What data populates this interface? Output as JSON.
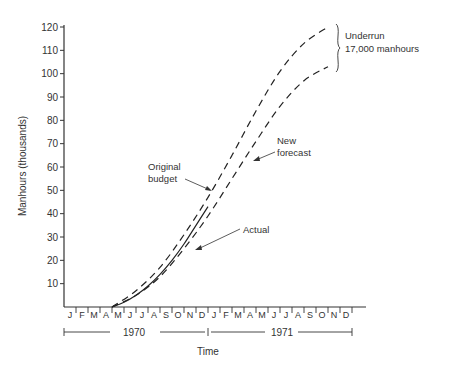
{
  "chart_data": {
    "type": "line",
    "title": "",
    "xlabel": "Time",
    "ylabel": "Manhours (thousands)",
    "ylim": [
      0,
      120
    ],
    "yticks": [
      10,
      20,
      30,
      40,
      50,
      60,
      70,
      80,
      90,
      100,
      110,
      120
    ],
    "months": [
      "J",
      "F",
      "M",
      "A",
      "M",
      "J",
      "J",
      "A",
      "S",
      "O",
      "N",
      "D",
      "J",
      "F",
      "M",
      "A",
      "M",
      "J",
      "J",
      "A",
      "S",
      "O",
      "N",
      "D"
    ],
    "years": [
      "1970",
      "1971"
    ],
    "grid": false,
    "series": [
      {
        "name": "Original budget",
        "style": "dashed",
        "x": [
          4,
          6,
          8,
          10,
          12,
          14,
          16,
          18,
          20,
          22
        ],
        "y": [
          0,
          7,
          17,
          31,
          47,
          65,
          84,
          101,
          113,
          120
        ]
      },
      {
        "name": "New forecast",
        "style": "dashed",
        "x": [
          4,
          6,
          8,
          10,
          12,
          14,
          16,
          18,
          20,
          22
        ],
        "y": [
          0,
          5,
          13,
          25,
          39,
          55,
          71,
          86,
          97,
          103
        ]
      },
      {
        "name": "Actual",
        "style": "solid",
        "x": [
          4,
          5,
          6,
          7,
          8,
          9,
          10,
          11,
          12
        ],
        "y": [
          0,
          2,
          5,
          9,
          14,
          20,
          27,
          35,
          43
        ]
      }
    ],
    "annotations": [
      {
        "text": "Original budget"
      },
      {
        "text": "New forecast"
      },
      {
        "text": "Actual"
      },
      {
        "text": "Underrun 17,000 manhours"
      }
    ]
  },
  "labels": {
    "ylabel": "Manhours (thousands)",
    "xlabel": "Time",
    "year1": "1970",
    "year2": "1971",
    "original_line1": "Original",
    "original_line2": "budget",
    "forecast_line1": "New",
    "forecast_line2": "forecast",
    "actual": "Actual",
    "underrun_line1": "Underrun",
    "underrun_line2": "17,000 manhours"
  }
}
